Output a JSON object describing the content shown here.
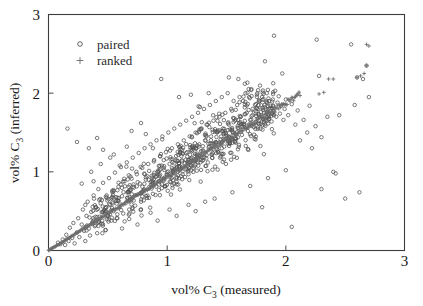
{
  "chart_data": {
    "type": "scatter",
    "title": "",
    "xlabel": "vol% C3 (measured)",
    "xlabel_main": "vol% C",
    "xlabel_sub": "3",
    "xlabel_tail": " (measured)",
    "ylabel": "vol% C3 (inferred)",
    "ylabel_main": "vol% C",
    "ylabel_sub": "3",
    "ylabel_tail": " (inferred)",
    "xlim": [
      0,
      3
    ],
    "ylim": [
      0,
      3
    ],
    "xticks": [
      0,
      1,
      2,
      3
    ],
    "yticks": [
      0,
      1,
      2,
      3
    ],
    "xtick_labels": [
      "0",
      "1",
      "2",
      "3"
    ],
    "ytick_labels": [
      "0",
      "1",
      "2",
      "3"
    ],
    "grid": false,
    "legend_position": "upper-left",
    "legend": [
      {
        "name": "paired",
        "marker": "open-circle",
        "color": "#4f4f4f"
      },
      {
        "name": "ranked",
        "marker": "plus",
        "color": "#6b6b6b"
      }
    ],
    "series": [
      {
        "name": "paired",
        "marker": "open-circle",
        "color": "#4f4f4f",
        "n_points": 820,
        "description": "Open circles scattered in a broad diagonal cloud about the 1:1 trend, densest between x=0.6 and x=1.8, with sparse outliers extending to x=2.7 and y=2.75",
        "points": [
          [
            0.08,
            0.1
          ],
          [
            0.1,
            0.08
          ],
          [
            0.12,
            0.14
          ],
          [
            0.14,
            0.07
          ],
          [
            0.15,
            0.2
          ],
          [
            0.17,
            0.12
          ],
          [
            0.18,
            0.29
          ],
          [
            0.2,
            0.16
          ],
          [
            0.21,
            0.35
          ],
          [
            0.16,
            1.55
          ],
          [
            0.22,
            0.09
          ],
          [
            0.24,
            0.23
          ],
          [
            0.25,
            0.41
          ],
          [
            0.26,
            0.17
          ],
          [
            0.28,
            0.33
          ],
          [
            0.29,
            0.52
          ],
          [
            0.3,
            0.25
          ],
          [
            0.31,
            0.12
          ],
          [
            0.32,
            0.44
          ],
          [
            0.33,
            0.62
          ],
          [
            0.34,
            0.28
          ],
          [
            0.35,
            0.19
          ],
          [
            0.36,
            0.49
          ],
          [
            0.37,
            0.36
          ],
          [
            0.24,
            1.38
          ],
          [
            0.38,
            0.7
          ],
          [
            0.39,
            0.31
          ],
          [
            0.4,
            0.55
          ],
          [
            0.41,
            0.22
          ],
          [
            0.42,
            0.78
          ],
          [
            0.43,
            0.43
          ],
          [
            0.44,
            0.6
          ],
          [
            0.45,
            0.34
          ],
          [
            0.46,
            0.86
          ],
          [
            0.47,
            0.51
          ],
          [
            0.48,
            0.26
          ],
          [
            0.49,
            0.67
          ],
          [
            0.5,
            0.45
          ],
          [
            0.51,
            0.92
          ],
          [
            0.52,
            0.58
          ],
          [
            0.34,
            1.3
          ],
          [
            0.53,
            0.38
          ],
          [
            0.54,
            0.74
          ],
          [
            0.55,
            0.5
          ],
          [
            0.56,
            0.99
          ],
          [
            0.57,
            0.63
          ],
          [
            0.58,
            0.41
          ],
          [
            0.59,
            0.81
          ],
          [
            0.6,
            0.55
          ],
          [
            0.61,
            1.06
          ],
          [
            0.62,
            0.69
          ],
          [
            0.63,
            0.47
          ],
          [
            0.64,
            0.88
          ],
          [
            0.65,
            0.6
          ],
          [
            0.66,
            1.12
          ],
          [
            0.67,
            0.75
          ],
          [
            0.41,
            1.43
          ],
          [
            0.68,
            0.52
          ],
          [
            0.69,
            0.94
          ],
          [
            0.7,
            0.66
          ],
          [
            0.71,
            1.18
          ],
          [
            0.72,
            0.8
          ],
          [
            0.73,
            0.57
          ],
          [
            0.74,
            1.0
          ],
          [
            0.75,
            0.71
          ],
          [
            0.76,
            1.24
          ],
          [
            0.77,
            0.85
          ],
          [
            0.78,
            0.62
          ],
          [
            0.79,
            1.05
          ],
          [
            0.8,
            0.76
          ],
          [
            0.81,
            1.3
          ],
          [
            0.82,
            0.9
          ],
          [
            0.52,
            1.18
          ],
          [
            0.83,
            0.67
          ],
          [
            0.84,
            1.1
          ],
          [
            0.85,
            0.81
          ],
          [
            0.86,
            1.35
          ],
          [
            0.87,
            0.95
          ],
          [
            0.88,
            0.72
          ],
          [
            0.89,
            1.15
          ],
          [
            0.9,
            0.86
          ],
          [
            0.91,
            1.4
          ],
          [
            0.92,
            1.0
          ],
          [
            0.93,
            0.77
          ],
          [
            0.94,
            1.2
          ],
          [
            0.95,
            0.91
          ],
          [
            0.96,
            1.45
          ],
          [
            0.97,
            1.05
          ],
          [
            0.6,
            1.08
          ],
          [
            0.98,
            0.82
          ],
          [
            0.99,
            1.25
          ],
          [
            1.0,
            0.96
          ],
          [
            1.01,
            1.5
          ],
          [
            1.02,
            1.1
          ],
          [
            1.03,
            0.87
          ],
          [
            1.04,
            1.3
          ],
          [
            1.05,
            1.01
          ],
          [
            1.06,
            1.55
          ],
          [
            1.07,
            1.15
          ],
          [
            1.08,
            0.92
          ],
          [
            1.09,
            1.35
          ],
          [
            1.1,
            1.06
          ],
          [
            1.11,
            1.6
          ],
          [
            1.12,
            1.2
          ],
          [
            0.7,
            1.52
          ],
          [
            1.13,
            0.97
          ],
          [
            1.14,
            1.4
          ],
          [
            1.15,
            1.11
          ],
          [
            1.16,
            1.65
          ],
          [
            1.17,
            1.25
          ],
          [
            1.18,
            1.02
          ],
          [
            1.19,
            1.45
          ],
          [
            1.2,
            1.16
          ],
          [
            1.21,
            1.7
          ],
          [
            1.22,
            1.3
          ],
          [
            1.23,
            1.07
          ],
          [
            1.24,
            1.5
          ],
          [
            1.25,
            1.21
          ],
          [
            1.26,
            1.75
          ],
          [
            1.27,
            1.35
          ],
          [
            0.78,
            1.62
          ],
          [
            1.28,
            1.12
          ],
          [
            1.29,
            1.55
          ],
          [
            1.3,
            1.26
          ],
          [
            1.31,
            1.8
          ],
          [
            1.32,
            1.4
          ],
          [
            1.33,
            1.17
          ],
          [
            1.34,
            1.6
          ],
          [
            1.35,
            1.31
          ],
          [
            1.36,
            1.85
          ],
          [
            1.37,
            1.45
          ],
          [
            1.38,
            1.22
          ],
          [
            1.39,
            1.65
          ],
          [
            1.4,
            1.36
          ],
          [
            1.41,
            1.9
          ],
          [
            1.42,
            1.5
          ],
          [
            0.88,
            1.3
          ],
          [
            1.43,
            1.27
          ],
          [
            1.44,
            1.7
          ],
          [
            1.45,
            1.41
          ],
          [
            1.46,
            1.95
          ],
          [
            1.47,
            1.55
          ],
          [
            1.48,
            1.32
          ],
          [
            1.49,
            1.75
          ],
          [
            1.5,
            1.46
          ],
          [
            1.51,
            2.0
          ],
          [
            1.52,
            1.6
          ],
          [
            1.53,
            1.37
          ],
          [
            1.54,
            1.8
          ],
          [
            1.55,
            1.51
          ],
          [
            1.56,
            1.9
          ],
          [
            1.57,
            1.65
          ],
          [
            0.95,
            2.18
          ],
          [
            1.58,
            1.42
          ],
          [
            1.59,
            1.85
          ],
          [
            1.6,
            1.56
          ],
          [
            1.61,
            1.95
          ],
          [
            1.62,
            1.7
          ],
          [
            1.63,
            1.47
          ],
          [
            1.64,
            1.9
          ],
          [
            1.65,
            1.61
          ],
          [
            1.66,
            2.0
          ],
          [
            1.67,
            1.75
          ],
          [
            1.68,
            1.52
          ],
          [
            1.69,
            1.95
          ],
          [
            1.7,
            1.66
          ],
          [
            1.71,
            2.05
          ],
          [
            1.72,
            1.8
          ],
          [
            1.1,
            1.95
          ],
          [
            1.73,
            1.57
          ],
          [
            1.74,
            1.85
          ],
          [
            1.75,
            1.71
          ],
          [
            1.76,
            2.0
          ],
          [
            1.77,
            1.62
          ],
          [
            1.78,
            1.9
          ],
          [
            1.79,
            1.76
          ],
          [
            1.8,
            1.95
          ],
          [
            1.81,
            1.67
          ],
          [
            1.82,
            1.85
          ],
          [
            1.83,
            1.8
          ],
          [
            1.84,
            2.0
          ],
          [
            1.85,
            1.72
          ],
          [
            1.86,
            1.9
          ],
          [
            1.87,
            1.84
          ],
          [
            1.2,
            1.98
          ],
          [
            1.88,
            1.64
          ],
          [
            1.89,
            1.92
          ],
          [
            1.9,
            1.78
          ],
          [
            1.91,
            2.03
          ],
          [
            1.92,
            1.7
          ],
          [
            1.93,
            1.88
          ],
          [
            1.94,
            1.96
          ],
          [
            1.95,
            1.74
          ],
          [
            1.96,
            1.84
          ],
          [
            1.97,
            2.25
          ],
          [
            1.98,
            1.66
          ],
          [
            1.99,
            1.8
          ],
          [
            2.0,
            1.92
          ],
          [
            2.02,
            1.72
          ],
          [
            2.05,
            1.86
          ],
          [
            1.35,
            2.0
          ],
          [
            2.08,
            1.6
          ],
          [
            2.1,
            1.78
          ],
          [
            2.12,
            1.4
          ],
          [
            2.15,
            1.66
          ],
          [
            2.18,
            1.5
          ],
          [
            2.2,
            1.84
          ],
          [
            2.22,
            1.3
          ],
          [
            2.25,
            1.58
          ],
          [
            2.28,
            2.22
          ],
          [
            2.3,
            1.44
          ],
          [
            2.35,
            1.7
          ],
          [
            2.4,
            1.0
          ],
          [
            2.42,
            0.98
          ],
          [
            2.45,
            1.72
          ],
          [
            2.5,
            0.66
          ],
          [
            1.52,
            2.2
          ],
          [
            2.55,
            2.62
          ],
          [
            2.58,
            1.85
          ],
          [
            2.6,
            2.2
          ],
          [
            2.62,
            0.74
          ],
          [
            2.65,
            2.18
          ],
          [
            2.68,
            2.35
          ],
          [
            2.7,
            1.95
          ],
          [
            1.6,
            2.18
          ],
          [
            1.9,
            2.73
          ],
          [
            2.26,
            2.68
          ],
          [
            2.05,
            0.3
          ],
          [
            1.8,
            0.55
          ],
          [
            2.3,
            0.78
          ],
          [
            0.62,
            0.28
          ],
          [
            0.75,
            0.33
          ],
          [
            0.44,
            1.1
          ],
          [
            0.38,
            0.88
          ],
          [
            0.55,
            1.22
          ],
          [
            0.66,
            1.32
          ],
          [
            0.82,
            1.48
          ],
          [
            0.49,
            0.7
          ],
          [
            0.58,
            0.46
          ],
          [
            0.31,
            0.58
          ],
          [
            0.28,
            0.85
          ],
          [
            0.36,
            1.0
          ],
          [
            0.46,
            1.28
          ],
          [
            0.68,
            0.4
          ],
          [
            0.86,
            0.48
          ],
          [
            1.02,
            0.52
          ],
          [
            1.18,
            0.58
          ],
          [
            1.32,
            0.62
          ],
          [
            0.92,
            0.38
          ],
          [
            1.08,
            0.44
          ],
          [
            1.24,
            0.5
          ],
          [
            1.4,
            0.66
          ],
          [
            1.55,
            0.74
          ],
          [
            1.7,
            0.82
          ],
          [
            1.85,
            0.92
          ],
          [
            2.0,
            1.02
          ]
        ]
      },
      {
        "name": "ranked",
        "marker": "plus",
        "color": "#6b6b6b",
        "n_points": 300,
        "description": "Plus markers forming a dense near-linear band from the origin rising to about (2.1, 2.0), with a few isolated plus markers at high values near (2.3, 2.0), (2.35, 2.18) and (2.7, 2.6)",
        "line_fit": {
          "x0": 0.0,
          "y0": 0.0,
          "x1": 2.12,
          "y1": 1.99
        },
        "outliers": [
          [
            2.28,
            1.99
          ],
          [
            2.32,
            2.01
          ],
          [
            2.36,
            2.18
          ],
          [
            2.4,
            2.18
          ],
          [
            2.6,
            2.2
          ],
          [
            2.63,
            2.22
          ],
          [
            2.66,
            2.25
          ],
          [
            2.68,
            2.62
          ],
          [
            2.7,
            2.6
          ],
          [
            2.68,
            2.35
          ],
          [
            1.72,
            1.77
          ],
          [
            1.8,
            1.8
          ]
        ]
      }
    ]
  },
  "axes": {
    "x_tick_labels": [
      "0",
      "1",
      "2",
      "3"
    ],
    "y_tick_labels": [
      "0",
      "1",
      "2",
      "3"
    ]
  }
}
